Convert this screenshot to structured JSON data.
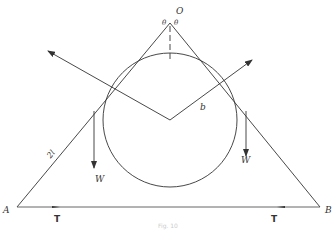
{
  "figure": {
    "type": "statics-diagram",
    "labels": {
      "apex": "O",
      "left_vertex": "A",
      "right_vertex": "B",
      "angle_left": "θ",
      "angle_right": "θ",
      "rod_length": "2l",
      "radius": "b",
      "weight_left": "W",
      "weight_right": "W",
      "tension_left": "T",
      "tension_right": "T"
    },
    "caption": "Fig. 10"
  }
}
